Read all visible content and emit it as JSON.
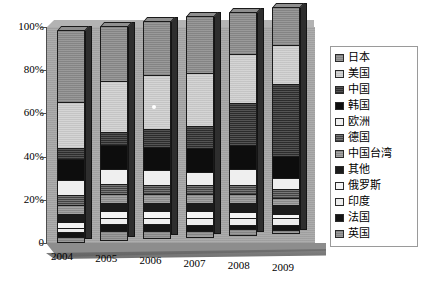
{
  "chart_data": {
    "type": "bar",
    "subtype": "100%-stacked-column-3d",
    "title": "",
    "xlabel": "",
    "ylabel": "",
    "categories": [
      "2004",
      "2005",
      "2006",
      "2007",
      "2008",
      "2009"
    ],
    "x_tick_labels": [
      "2004",
      "2005",
      "2006",
      "2007",
      "2008",
      "2009"
    ],
    "y_tick_labels": [
      "0",
      "20%",
      "40%",
      "60%",
      "80%",
      "100%"
    ],
    "y_tick_values": [
      0,
      20,
      40,
      60,
      80,
      100
    ],
    "ylim": [
      0,
      100
    ],
    "grid": false,
    "legend_position": "right",
    "stack_order_bottom_to_top": [
      "英国",
      "法国",
      "印度",
      "俄罗斯",
      "其他",
      "中国台湾",
      "德国",
      "欧洲",
      "韩国",
      "中国",
      "美国",
      "日本"
    ],
    "series": [
      {
        "name": "日本",
        "key": "japan",
        "values": [
          34,
          26,
          25,
          26,
          19,
          17
        ]
      },
      {
        "name": "美国",
        "key": "usa",
        "values": [
          22,
          24,
          25,
          24,
          22,
          17
        ]
      },
      {
        "name": "中国",
        "key": "china",
        "values": [
          5,
          6,
          8,
          10,
          19,
          32
        ]
      },
      {
        "name": "韩国",
        "key": "korea",
        "values": [
          10,
          11,
          11,
          11,
          11,
          10
        ]
      },
      {
        "name": "欧洲",
        "key": "europe",
        "values": [
          7,
          7,
          7,
          6,
          7,
          5
        ]
      },
      {
        "name": "德国",
        "key": "germany",
        "values": [
          5,
          5,
          4,
          4,
          4,
          4
        ]
      },
      {
        "name": "中国台湾",
        "key": "taiwan",
        "values": [
          4,
          4,
          4,
          4,
          4,
          3
        ]
      },
      {
        "name": "其他",
        "key": "other",
        "values": [
          4,
          4,
          4,
          4,
          4,
          4
        ]
      },
      {
        "name": "俄罗斯",
        "key": "russia",
        "values": [
          3,
          3,
          3,
          3,
          3,
          2
        ]
      },
      {
        "name": "印度",
        "key": "india",
        "values": [
          2,
          3,
          3,
          3,
          3,
          3
        ]
      },
      {
        "name": "法国",
        "key": "france",
        "values": [
          2,
          3,
          3,
          3,
          2,
          2
        ]
      },
      {
        "name": "英国",
        "key": "uk",
        "values": [
          2,
          4,
          3,
          2,
          2,
          1
        ]
      }
    ]
  },
  "axes": {
    "y_labels": [
      "100%",
      "80%",
      "60%",
      "40%",
      "20%",
      "0"
    ],
    "x_labels": [
      "2004",
      "2005",
      "2006",
      "2007",
      "2008",
      "2009"
    ]
  },
  "legend": {
    "items": [
      {
        "label": "日本",
        "swatch": "f-japan"
      },
      {
        "label": "美国",
        "swatch": "f-usa"
      },
      {
        "label": "中国",
        "swatch": "f-china"
      },
      {
        "label": "韩国",
        "swatch": "f-korea"
      },
      {
        "label": "欧洲",
        "swatch": "f-europe"
      },
      {
        "label": "德国",
        "swatch": "f-germany"
      },
      {
        "label": "中国台湾",
        "swatch": "f-taiwan"
      },
      {
        "label": "其他",
        "swatch": "f-other"
      },
      {
        "label": "俄罗斯",
        "swatch": "f-russia"
      },
      {
        "label": "印度",
        "swatch": "f-india"
      },
      {
        "label": "法国",
        "swatch": "f-france"
      },
      {
        "label": "英国",
        "swatch": "f-uk"
      }
    ]
  },
  "colors": {
    "background": "#ffffff",
    "wall": "#a8a8a8",
    "floor": "#8d8d8d",
    "axis": "#4d4d4d",
    "bar_outline": "#1a1a1a"
  }
}
